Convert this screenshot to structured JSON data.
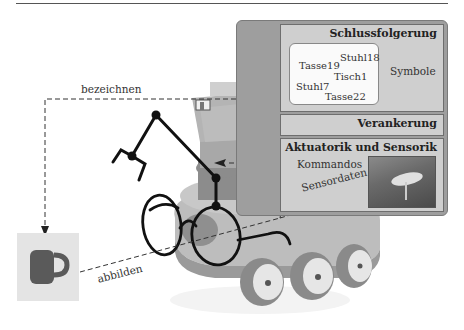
{
  "figure": {
    "layers": [
      {
        "id": "schlussfolgerung",
        "title": "Schlussfolgerung"
      },
      {
        "id": "verankerung",
        "title": "Verankerung"
      },
      {
        "id": "aktuatorik",
        "title": "Aktuatorik und Sensorik"
      }
    ],
    "symbols": {
      "items": [
        "Tasse19",
        "Stuhl18",
        "Tisch1",
        "Stuhl7",
        "Tasse22"
      ],
      "label": "Symbole"
    },
    "actuation": {
      "commands_label": "Kommandos",
      "sensor_label": "Sensordaten"
    },
    "edges": {
      "denote_label": "bezeichnen",
      "depict_label": "abbilden"
    },
    "object": {
      "name": "mug"
    },
    "colors": {
      "panel_outer": "#9e9e9e",
      "layer_fill": "#cfcfcf",
      "symbol_box": "#fafafa",
      "robot_light": "#c4c4c4",
      "robot_dark": "#7e7e7e",
      "mug": "#5a5a5a"
    }
  }
}
